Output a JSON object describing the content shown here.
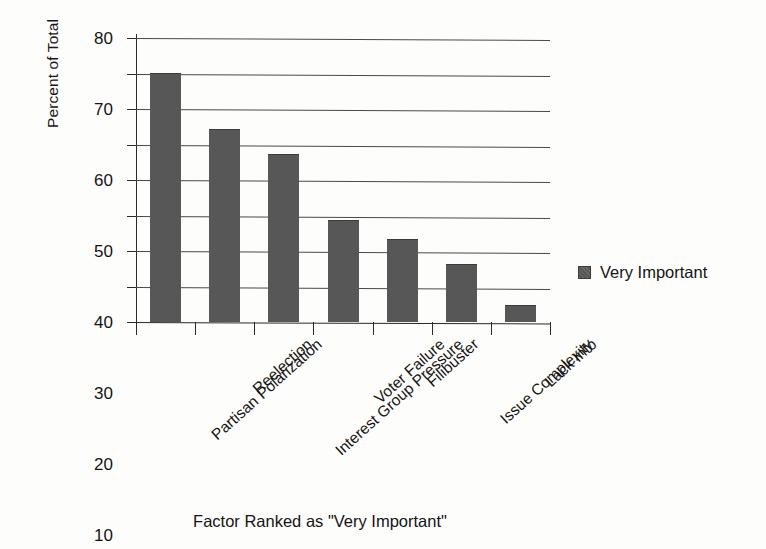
{
  "chart_data": {
    "type": "bar",
    "title": "",
    "xlabel": "Factor Ranked as \"Very Important\"",
    "ylabel": "Percent of Total",
    "ylim": [
      0,
      80
    ],
    "yticks": [
      0,
      10,
      20,
      30,
      40,
      50,
      60,
      70,
      80
    ],
    "ytick_labels": [
      "0",
      "10",
      "20",
      "30",
      "40",
      "50",
      "60",
      "70",
      "80"
    ],
    "grid": true,
    "legend_position": "right",
    "categories": [
      "Partisan Polarization",
      "Reelection",
      "Interest Group Pressure",
      "Voter Failure",
      "Filibuster",
      "Issue Complexity",
      "Lack Info"
    ],
    "series": [
      {
        "name": "Very Important",
        "color": "#575757",
        "values": [
          70,
          54,
          47,
          28.5,
          23,
          16,
          4.5
        ]
      }
    ]
  },
  "legend": {
    "entries": [
      {
        "label": "Very Important",
        "swatch": "legend-swatch-very-important"
      }
    ]
  },
  "axes": {
    "y_title": "Percent of Total",
    "x_title": "Factor Ranked as \"Very Important\""
  }
}
